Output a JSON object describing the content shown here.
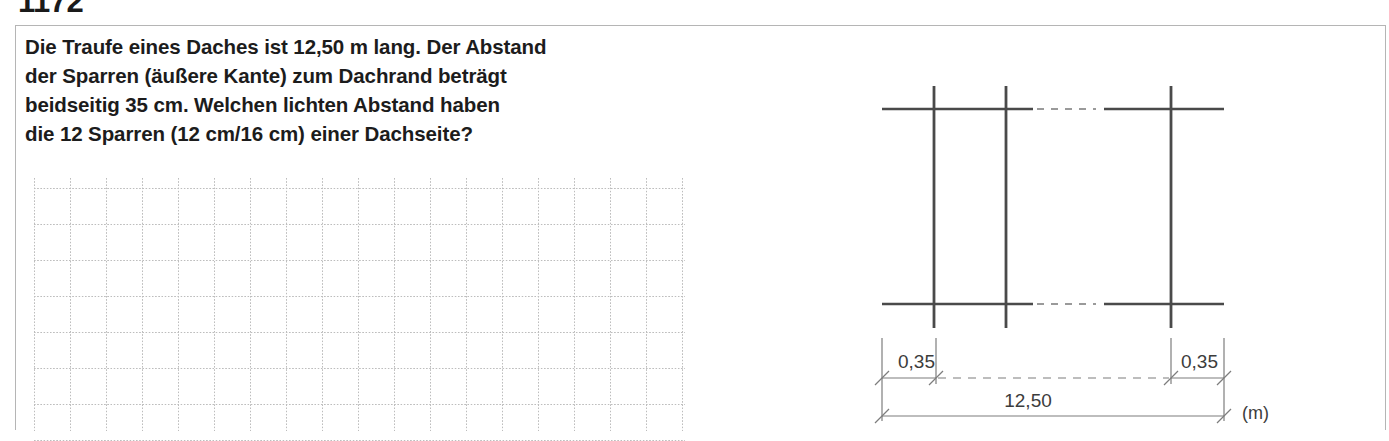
{
  "exercise": {
    "number": "1172",
    "question_lines": [
      "Die Traufe eines Daches ist 12,50 m lang. Der Abstand",
      "der Sparren (äußere Kante) zum Dachrand beträgt",
      "beidseitig 35 cm. Welchen lichten Abstand haben",
      "die 12 Sparren (12 cm/16 cm) einer Dachseite?"
    ]
  },
  "answer_area": {
    "grid_columns": 18,
    "grid_rows": 7,
    "grid_spacing_px": 36,
    "grid_color": "#bdbdbd"
  },
  "drawing": {
    "title": "Dachsparren-Skizze",
    "line_color": "#4a4a4a",
    "dimension_color": "#6e6e6e",
    "text_color": "#3c3c3c",
    "labels": {
      "left_offset": "0,35",
      "right_offset": "0,35",
      "total_length": "12,50",
      "unit": "(m)"
    },
    "rafters": [
      {
        "name": "rafter-left-outer",
        "x": 78
      },
      {
        "name": "rafter-left-inner",
        "x": 150
      },
      {
        "name": "rafter-right-outer",
        "x": 315
      }
    ],
    "eaves_lines": [
      {
        "name": "eave-top",
        "y": 43
      },
      {
        "name": "eave-bottom",
        "y": 238
      }
    ],
    "break_dashes": {
      "from_x": 177,
      "to_x": 245
    }
  }
}
